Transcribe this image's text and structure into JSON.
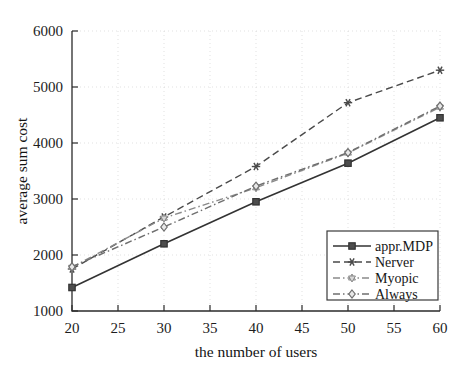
{
  "figure": {
    "background_color": "#ffffff",
    "ink_color": "#2b2b2b",
    "grid_color": "#cfcfcf"
  },
  "chart_data": {
    "type": "line",
    "title": "",
    "xlabel": "the number of users",
    "ylabel": "average sum cost",
    "x": [
      20,
      30,
      40,
      50,
      60
    ],
    "xlim": [
      20,
      60
    ],
    "ylim": [
      1000,
      6000
    ],
    "xticks": [
      20,
      25,
      30,
      35,
      40,
      45,
      50,
      55,
      60
    ],
    "yticks": [
      1000,
      2000,
      3000,
      4000,
      5000,
      6000
    ],
    "xtick_labels": [
      "20",
      "25",
      "30",
      "35",
      "40",
      "45",
      "50",
      "55",
      "60"
    ],
    "ytick_labels": [
      "1000",
      "2000",
      "3000",
      "4000",
      "5000",
      "6000"
    ],
    "grid": true,
    "legend_position": "lower right",
    "series": [
      {
        "name": "appr.MDP",
        "values": [
          1420,
          2200,
          2950,
          3640,
          4450
        ],
        "line_style": "solid",
        "marker": "square",
        "color": "#333333"
      },
      {
        "name": "Nerver",
        "values": [
          1750,
          2680,
          3580,
          4720,
          5300
        ],
        "line_style": "dashed",
        "marker": "asterisk",
        "color": "#4a4a4a"
      },
      {
        "name": "Myopic",
        "values": [
          1780,
          2660,
          3200,
          3820,
          4640
        ],
        "line_style": "dashdot",
        "marker": "hexagram",
        "color": "#8a8a8a"
      },
      {
        "name": "Always",
        "values": [
          1790,
          2500,
          3230,
          3830,
          4660
        ],
        "line_style": "dashdot",
        "marker": "diamond",
        "color": "#6f6f6f"
      }
    ]
  },
  "legend": {
    "entries": [
      {
        "label": "appr.MDP"
      },
      {
        "label": "Nerver"
      },
      {
        "label": "Myopic"
      },
      {
        "label": "Always"
      }
    ]
  }
}
